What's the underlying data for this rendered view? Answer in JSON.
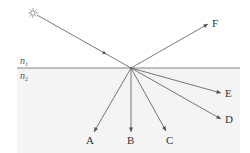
{
  "diagram": {
    "type": "reflection-refraction",
    "colors": {
      "line": "#555555",
      "medium2_fill": "#f4f4f4",
      "text": "#333333"
    },
    "source": {
      "icon": "sun-icon",
      "x": 33,
      "y": 13
    },
    "interface": {
      "x1": 17,
      "x2": 240,
      "y": 68
    },
    "incidence_point": {
      "x": 131,
      "y": 68
    },
    "media": [
      {
        "id": "n1",
        "label": "n",
        "sub": "1",
        "x": 20,
        "y": 64
      },
      {
        "id": "n2",
        "label": "n",
        "sub": "2",
        "x": 20,
        "y": 79
      }
    ],
    "rays": [
      {
        "id": "F",
        "label": "F",
        "x": 208,
        "y": 24,
        "lx": 212,
        "ly": 27
      },
      {
        "id": "E",
        "label": "E",
        "x": 221,
        "y": 93,
        "lx": 225,
        "ly": 97
      },
      {
        "id": "D",
        "label": "D",
        "x": 221,
        "y": 119,
        "lx": 225,
        "ly": 123
      },
      {
        "id": "C",
        "label": "C",
        "x": 166,
        "y": 131,
        "lx": 166,
        "ly": 144
      },
      {
        "id": "B",
        "label": "B",
        "x": 131,
        "y": 132,
        "lx": 127,
        "ly": 144
      },
      {
        "id": "A",
        "label": "A",
        "x": 94,
        "y": 132,
        "lx": 86,
        "ly": 144
      }
    ]
  }
}
